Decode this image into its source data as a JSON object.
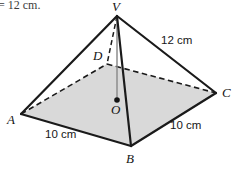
{
  "figure": {
    "type": "square-based-pyramid",
    "background_color": "#ffffff",
    "base_fill_color": "#d9d9d9",
    "edge_color": "#1a1a1a",
    "hidden_edge_style": "dashed",
    "height_line_color": "#8c8c8c",
    "cropped_text_fragment": "= 12 cm.",
    "vertices": {
      "V": {
        "label": "V",
        "x": 117,
        "y": 16
      },
      "A": {
        "label": "A",
        "x": 21,
        "y": 114
      },
      "B": {
        "label": "B",
        "x": 131,
        "y": 146
      },
      "C": {
        "label": "C",
        "x": 216,
        "y": 93
      },
      "D": {
        "label": "D",
        "x": 107,
        "y": 64
      },
      "O": {
        "label": "O",
        "x": 117,
        "y": 100
      }
    },
    "measurements": {
      "slant_edge": "12 cm",
      "base_edge_left": "10 cm",
      "base_edge_right": "10 cm"
    },
    "edges": [
      {
        "name": "V-A",
        "from": "V",
        "to": "A",
        "style": "solid",
        "hidden": false
      },
      {
        "name": "V-B",
        "from": "V",
        "to": "B",
        "style": "solid",
        "hidden": false
      },
      {
        "name": "V-C",
        "from": "V",
        "to": "C",
        "style": "solid",
        "hidden": false
      },
      {
        "name": "V-D",
        "from": "V",
        "to": "D",
        "style": "dashed",
        "hidden": true
      },
      {
        "name": "A-B",
        "from": "A",
        "to": "B",
        "style": "solid",
        "hidden": false
      },
      {
        "name": "B-C",
        "from": "B",
        "to": "C",
        "style": "solid",
        "hidden": false
      },
      {
        "name": "C-D",
        "from": "C",
        "to": "D",
        "style": "dashed",
        "hidden": true
      },
      {
        "name": "D-A",
        "from": "D",
        "to": "A",
        "style": "dashed",
        "hidden": true
      },
      {
        "name": "V-O",
        "from": "V",
        "to": "O",
        "style": "thin-solid",
        "hidden": false
      }
    ]
  }
}
